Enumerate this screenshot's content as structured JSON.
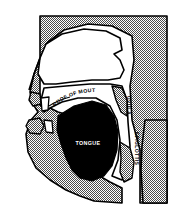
{
  "figure": {
    "type": "anatomical-diagram",
    "orientation": "profile facing left",
    "background_color": "#ffffff",
    "tissue_fill_color": "#999999",
    "cavity_fill_color": "#ffffff",
    "tongue_fill_color": "#000000",
    "outline_color": "#000000",
    "label_color_on_light": "#000000",
    "label_color_on_dark": "#ffffff"
  },
  "labels": {
    "roof_of_mouth": "ROOF OF MOUTH",
    "tongue": "TONGUE",
    "uvula": "UVULA",
    "epiglottis": "EPIGLOTTIS"
  },
  "regions": [
    {
      "name": "head-tissue",
      "label": "",
      "fill": "#999999"
    },
    {
      "name": "nasal-cavity",
      "label": "",
      "fill": "#ffffff"
    },
    {
      "name": "oral-cavity",
      "label": "",
      "fill": "#ffffff"
    },
    {
      "name": "tongue-mass",
      "label": "TONGUE",
      "fill": "#000000"
    },
    {
      "name": "pharynx-airway",
      "label": "",
      "fill": "#ffffff"
    },
    {
      "name": "neck-tissue",
      "label": "",
      "fill": "#999999"
    },
    {
      "name": "upper-teeth",
      "label": "",
      "fill": "#ffffff"
    },
    {
      "name": "lower-teeth",
      "label": "",
      "fill": "#ffffff"
    }
  ]
}
